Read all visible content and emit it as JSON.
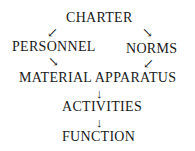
{
  "diagram": {
    "nodes": {
      "charter": "CHARTER",
      "personnel": "PERSONNEL",
      "norms": "NORMS",
      "material_apparatus": "MATERIAL APPARATUS",
      "activities": "ACTIVITIES",
      "function": "FUNCTION"
    },
    "arrows": {
      "down_left": "↙",
      "down_right": "↘",
      "down": "↓"
    },
    "edges": [
      [
        "CHARTER",
        "PERSONNEL"
      ],
      [
        "CHARTER",
        "NORMS"
      ],
      [
        "PERSONNEL",
        "MATERIAL APPARATUS"
      ],
      [
        "NORMS",
        "MATERIAL APPARATUS"
      ],
      [
        "MATERIAL APPARATUS",
        "ACTIVITIES"
      ],
      [
        "ACTIVITIES",
        "FUNCTION"
      ]
    ]
  }
}
